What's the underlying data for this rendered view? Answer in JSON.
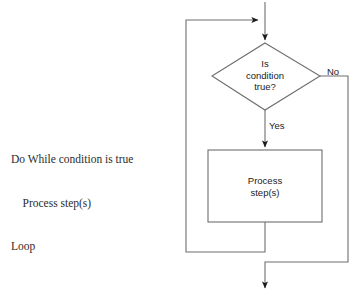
{
  "figure": {
    "type": "flowchart"
  },
  "pseudocode": {
    "lines": [
      "Do While condition is true",
      "    Process step(s)",
      "Loop"
    ]
  },
  "flowchart": {
    "decision": {
      "shape": "diamond",
      "text": "Is\ncondition\ntrue?"
    },
    "process": {
      "shape": "rectangle",
      "text": "Process\nstep(s)"
    },
    "edges": {
      "yes_label": "Yes",
      "no_label": "No"
    }
  },
  "caption": {
    "text": ""
  },
  "colors": {
    "background": "#ffffff",
    "stroke": "#6e6e70",
    "arrow": "#1a1a1a",
    "text": "#1a1a1a",
    "pseudocode_text": "#2b2b2b"
  }
}
